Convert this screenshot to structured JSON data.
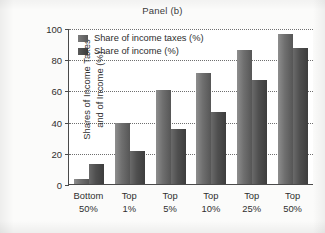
{
  "chart_data": {
    "type": "bar",
    "title": "Panel (b)",
    "xlabel": "",
    "ylabel": "Shares of Income Taxes and of Income (%)",
    "ylabel_line1": "Shares of Income Taxes",
    "ylabel_line2": "and of Income (%)",
    "categories": [
      "Bottom 50%",
      "Top 1%",
      "Top 5%",
      "Top 10%",
      "Top 25%",
      "Top 50%"
    ],
    "category_lines": [
      {
        "l1": "Bottom",
        "l2": "50%"
      },
      {
        "l1": "Top",
        "l2": "1%"
      },
      {
        "l1": "Top",
        "l2": "5%"
      },
      {
        "l1": "Top",
        "l2": "10%"
      },
      {
        "l1": "Top",
        "l2": "25%"
      },
      {
        "l1": "Top",
        "l2": "50%"
      }
    ],
    "series": [
      {
        "name": "Share of income taxes (%)",
        "color": "#6f6f6f",
        "values": [
          3,
          39,
          60,
          71,
          86,
          96
        ]
      },
      {
        "name": "Share of income (%)",
        "color": "#4a4a4a",
        "values": [
          13,
          21,
          35,
          46,
          66.5,
          87
        ]
      }
    ],
    "ylim": [
      0,
      100
    ],
    "yticks": [
      0,
      20,
      40,
      60,
      80,
      100
    ],
    "ytick_labels": [
      "0",
      "20",
      "40",
      "60",
      "80",
      "100"
    ],
    "grid": true,
    "grid_style": "dotted-horizontal",
    "legend_position": "top-left-inside"
  }
}
